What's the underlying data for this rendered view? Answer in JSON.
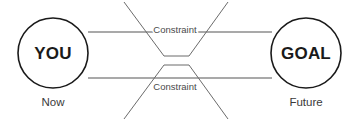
{
  "diagram": {
    "background_color": "#ffffff",
    "nodes": [
      {
        "id": "you",
        "label": "YOU",
        "time_label": "Now",
        "cx": 53,
        "cy": 53,
        "r": 35,
        "stroke_color": "#1a1a1a",
        "fill_color": "#ffffff",
        "text_color": "#1a1a1a"
      },
      {
        "id": "goal",
        "label": "GOAL",
        "time_label": "Future",
        "cx": 306,
        "cy": 53,
        "r": 35,
        "stroke_color": "#1a1a1a",
        "fill_color": "#ffffff",
        "text_color": "#1a1a1a"
      }
    ],
    "flow_lines": [
      {
        "id": "top-flow",
        "x1": 88,
        "y1": 32,
        "x2": 272,
        "y2": 32,
        "color": "#555555"
      },
      {
        "id": "bottom-flow",
        "x1": 88,
        "y1": 78,
        "x2": 272,
        "y2": 78,
        "color": "#555555"
      }
    ],
    "constraints": [
      {
        "id": "top-constraint",
        "label": "Constraint",
        "orientation": "funnel-down",
        "points": "124,2 164,56 189,56 228,2",
        "label_x": 175,
        "label_y": 33,
        "color": "#6b6b6b"
      },
      {
        "id": "bottom-constraint",
        "label": "Constraint",
        "orientation": "funnel-up",
        "points": "124,119 164,65 189,65 228,119",
        "label_x": 175,
        "label_y": 90,
        "color": "#6b6b6b"
      }
    ],
    "stroke_widths": {
      "circle": 1.6,
      "flow": 1.1,
      "funnel": 1.0
    }
  }
}
